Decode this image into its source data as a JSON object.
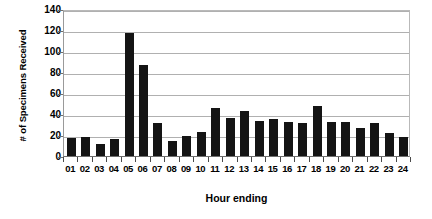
{
  "chart_data": {
    "type": "bar",
    "title": "",
    "xlabel": "Hour ending",
    "ylabel": "# of Specimens Received",
    "categories": [
      "01",
      "02",
      "03",
      "04",
      "05",
      "06",
      "07",
      "08",
      "09",
      "10",
      "11",
      "12",
      "13",
      "14",
      "15",
      "16",
      "17",
      "18",
      "19",
      "20",
      "21",
      "22",
      "23",
      "24"
    ],
    "values": [
      17,
      18,
      11,
      16,
      117,
      87,
      31,
      14,
      19,
      23,
      46,
      36,
      43,
      33,
      35,
      32,
      31,
      48,
      32,
      32,
      27,
      31,
      22,
      18
    ],
    "ylim": [
      0,
      140
    ],
    "yticks": [
      0,
      20,
      40,
      60,
      80,
      100,
      120,
      140
    ],
    "ytick_labels": [
      "0",
      "20",
      "40",
      "60",
      "80",
      "100",
      "120",
      "140"
    ],
    "grid": true,
    "legend": "none",
    "series_color": "#141414",
    "gridline_color": "#b0b0b0",
    "axis_color": "#6e6e6e",
    "background": "#ffffff"
  }
}
